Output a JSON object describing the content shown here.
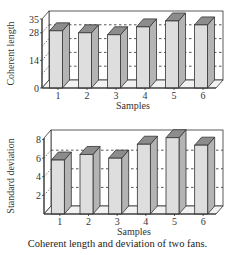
{
  "caption": "Coherent length and deviation of two fans.",
  "chart_data": [
    {
      "type": "bar",
      "style": "3d",
      "title": "",
      "xlabel": "Samples",
      "ylabel": "Coherent length",
      "categories": [
        "1",
        "2",
        "3",
        "4",
        "5",
        "6"
      ],
      "values": [
        29,
        28,
        27,
        31,
        34,
        32
      ],
      "yticks": [
        0,
        14,
        28,
        35
      ],
      "gridlines": [
        7,
        14,
        21,
        28
      ],
      "ylim": [
        0,
        35
      ],
      "grid": "dashed",
      "legend": null
    },
    {
      "type": "bar",
      "style": "3d",
      "title": "",
      "xlabel": "Samples",
      "ylabel": "Standard deviation",
      "categories": [
        "1",
        "2",
        "3",
        "4",
        "5",
        "6"
      ],
      "values": [
        5.8,
        6.4,
        6.0,
        7.5,
        8.2,
        7.4
      ],
      "yticks": [
        2,
        4,
        6,
        8
      ],
      "gridlines": [
        2,
        4,
        6
      ],
      "ylim": [
        0,
        8.6
      ],
      "grid": "dashed",
      "legend": null
    }
  ],
  "colors": {
    "bar_front": "#dedede",
    "bar_side": "#b4b4b4",
    "bar_top": "#8c8c8c",
    "outline": "#333333",
    "grid": "#444444"
  }
}
